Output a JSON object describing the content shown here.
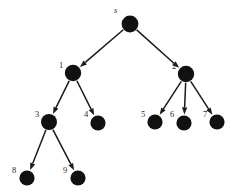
{
  "diagram": {
    "background_color": "#ffffff",
    "node_color": "#111111",
    "edge_color": "#1a1a1a",
    "label_color": "#2b2b2b",
    "node_radius": 8.0,
    "leaf_radius": 7.4,
    "width": 231,
    "height": 195,
    "nodes": [
      {
        "id": "s",
        "label": "s",
        "cx": 130,
        "cy": 24,
        "r": 8.4,
        "italic": true,
        "label_x": 114,
        "label_y": 6
      },
      {
        "id": "1",
        "label": "1",
        "cx": 73,
        "cy": 73,
        "r": 8.2,
        "italic": false,
        "label_x": 59,
        "label_y": 61
      },
      {
        "id": "2",
        "label": "2",
        "cx": 186,
        "cy": 74,
        "r": 8.2,
        "italic": false,
        "label_x": 172,
        "label_y": 62
      },
      {
        "id": "3",
        "label": "3",
        "cx": 49,
        "cy": 122,
        "r": 8.0,
        "italic": false,
        "label_x": 35,
        "label_y": 110
      },
      {
        "id": "4",
        "label": "4",
        "cx": 98,
        "cy": 123,
        "r": 7.6,
        "italic": false,
        "label_x": 84,
        "label_y": 110
      },
      {
        "id": "5",
        "label": "5",
        "cx": 155,
        "cy": 122,
        "r": 7.6,
        "italic": false,
        "label_x": 141,
        "label_y": 110
      },
      {
        "id": "6",
        "label": "6",
        "cx": 184,
        "cy": 123,
        "r": 7.6,
        "italic": false,
        "label_x": 170,
        "label_y": 110
      },
      {
        "id": "7",
        "label": "7",
        "cx": 217,
        "cy": 122,
        "r": 7.6,
        "italic": false,
        "label_x": 203,
        "label_y": 110
      },
      {
        "id": "8",
        "label": "8",
        "cx": 27,
        "cy": 178,
        "r": 7.6,
        "italic": false,
        "label_x": 12,
        "label_y": 166
      },
      {
        "id": "9",
        "label": "9",
        "cx": 78,
        "cy": 178,
        "r": 7.6,
        "italic": false,
        "label_x": 63,
        "label_y": 166
      }
    ],
    "edges": [
      {
        "from": "s",
        "to": "1"
      },
      {
        "from": "s",
        "to": "2"
      },
      {
        "from": "1",
        "to": "3"
      },
      {
        "from": "1",
        "to": "4"
      },
      {
        "from": "2",
        "to": "5"
      },
      {
        "from": "2",
        "to": "6"
      },
      {
        "from": "2",
        "to": "7"
      },
      {
        "from": "3",
        "to": "8"
      },
      {
        "from": "3",
        "to": "9"
      }
    ]
  }
}
